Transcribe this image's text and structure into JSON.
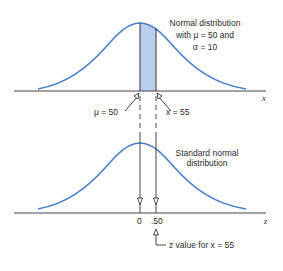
{
  "top_panel": {
    "title_line1": "Normal distribution",
    "title_line2": "with  μ  = 50 and",
    "title_line3": "σ = 10",
    "axis_label": "x",
    "mean_label": "μ = 50",
    "x_value_label": "x = 55",
    "shaded_region": "between μ = 50 and x = 55"
  },
  "bottom_panel": {
    "title_line1": "Standard normal",
    "title_line2": "distribution",
    "axis_label": "z",
    "tick_zero": "0",
    "tick_z": ".50",
    "annotation": "z value for x = 55"
  },
  "colors": {
    "curve": "#4a7fc8",
    "shade": "#b8cfee",
    "axis": "#333333",
    "text": "#2b2b2b"
  }
}
